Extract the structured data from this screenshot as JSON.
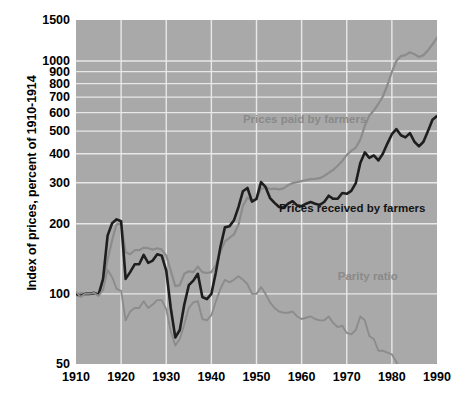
{
  "chart_data": {
    "type": "line",
    "title": "",
    "xlabel": "",
    "ylabel": "Index of prices, percent of 1910-1914",
    "yscale": "log",
    "ylim": [
      50,
      1500
    ],
    "xlim": [
      1910,
      1990
    ],
    "grid": true,
    "legend_position": "inline-annotations",
    "ytick_labels": [
      "1500",
      "1000",
      "900",
      "800",
      "700",
      "600",
      "500",
      "400",
      "300",
      "200",
      "100",
      "50"
    ],
    "ytick_values": [
      1500,
      1000,
      900,
      800,
      700,
      600,
      500,
      400,
      300,
      200,
      100,
      50
    ],
    "xtick_labels": [
      "1910",
      "1920",
      "1930",
      "1940",
      "1950",
      "1960",
      "1970",
      "1980",
      "1990"
    ],
    "xtick_values": [
      1910,
      1920,
      1930,
      1940,
      1950,
      1960,
      1970,
      1980,
      1990
    ],
    "plot_background": "#a9a9a9",
    "gridline_color": "#e8e8e8",
    "series": [
      {
        "name": "Prices paid by farmers",
        "color": "#8c8c8c",
        "label_color": "#8a8a8a",
        "label_x": 1947,
        "label_y": 560,
        "x": [
          1910,
          1911,
          1912,
          1913,
          1914,
          1915,
          1916,
          1917,
          1918,
          1919,
          1920,
          1921,
          1922,
          1923,
          1924,
          1925,
          1926,
          1927,
          1928,
          1929,
          1930,
          1931,
          1932,
          1933,
          1934,
          1935,
          1936,
          1937,
          1938,
          1939,
          1940,
          1941,
          1942,
          1943,
          1944,
          1945,
          1946,
          1947,
          1948,
          1949,
          1950,
          1951,
          1952,
          1953,
          1954,
          1955,
          1956,
          1957,
          1958,
          1959,
          1960,
          1961,
          1962,
          1963,
          1964,
          1965,
          1966,
          1967,
          1968,
          1969,
          1970,
          1971,
          1972,
          1973,
          1974,
          1975,
          1976,
          1977,
          1978,
          1979,
          1980,
          1981,
          1982,
          1983,
          1984,
          1985,
          1986,
          1987,
          1988,
          1989,
          1990
        ],
        "values": [
          98,
          101,
          100,
          100,
          100,
          101,
          112,
          140,
          170,
          199,
          200,
          151,
          148,
          154,
          154,
          158,
          157,
          155,
          157,
          155,
          146,
          126,
          108,
          109,
          122,
          125,
          124,
          131,
          124,
          123,
          124,
          133,
          152,
          168,
          174,
          180,
          198,
          239,
          259,
          250,
          256,
          282,
          287,
          282,
          283,
          281,
          284,
          293,
          299,
          302,
          305,
          308,
          311,
          312,
          314,
          321,
          331,
          341,
          355,
          372,
          395,
          411,
          425,
          459,
          527,
          583,
          613,
          654,
          704,
          787,
          898,
          1000,
          1050,
          1060,
          1090,
          1070,
          1040,
          1060,
          1110,
          1180,
          1260
        ]
      },
      {
        "name": "Prices received by farmers",
        "color": "#1e1e1e",
        "label_color": "#141414",
        "label_x": 1955,
        "label_y": 232,
        "x": [
          1910,
          1911,
          1912,
          1913,
          1914,
          1915,
          1916,
          1917,
          1918,
          1919,
          1920,
          1921,
          1922,
          1923,
          1924,
          1925,
          1926,
          1927,
          1928,
          1929,
          1930,
          1931,
          1932,
          1933,
          1934,
          1935,
          1936,
          1937,
          1938,
          1939,
          1940,
          1941,
          1942,
          1943,
          1944,
          1945,
          1946,
          1947,
          1948,
          1949,
          1950,
          1951,
          1952,
          1953,
          1954,
          1955,
          1956,
          1957,
          1958,
          1959,
          1960,
          1961,
          1962,
          1963,
          1964,
          1965,
          1966,
          1967,
          1968,
          1969,
          1970,
          1971,
          1972,
          1973,
          1974,
          1975,
          1976,
          1977,
          1978,
          1979,
          1980,
          1981,
          1982,
          1983,
          1984,
          1985,
          1986,
          1987,
          1988,
          1989,
          1990
        ],
        "values": [
          100,
          98,
          100,
          100,
          101,
          99,
          116,
          178,
          201,
          209,
          205,
          116,
          124,
          134,
          134,
          147,
          136,
          139,
          148,
          146,
          126,
          87,
          65,
          70,
          90,
          109,
          114,
          122,
          97,
          95,
          100,
          124,
          159,
          193,
          195,
          207,
          236,
          276,
          285,
          249,
          256,
          302,
          288,
          258,
          246,
          236,
          235,
          244,
          250,
          240,
          238,
          244,
          248,
          244,
          241,
          248,
          264,
          256,
          256,
          271,
          269,
          277,
          299,
          365,
          405,
          384,
          393,
          374,
          400,
          442,
          485,
          510,
          480,
          470,
          490,
          450,
          430,
          450,
          500,
          560,
          580
        ]
      },
      {
        "name": "Parity ratio",
        "color": "#8c8c8c",
        "label_color": "#8a8a8a",
        "label_x": 1968,
        "label_y": 118,
        "x": [
          1910,
          1911,
          1912,
          1913,
          1914,
          1915,
          1916,
          1917,
          1918,
          1919,
          1920,
          1921,
          1922,
          1923,
          1924,
          1925,
          1926,
          1927,
          1928,
          1929,
          1930,
          1931,
          1932,
          1933,
          1934,
          1935,
          1936,
          1937,
          1938,
          1939,
          1940,
          1941,
          1942,
          1943,
          1944,
          1945,
          1946,
          1947,
          1948,
          1949,
          1950,
          1951,
          1952,
          1953,
          1954,
          1955,
          1956,
          1957,
          1958,
          1959,
          1960,
          1961,
          1962,
          1963,
          1964,
          1965,
          1966,
          1967,
          1968,
          1969,
          1970,
          1971,
          1972,
          1973,
          1974,
          1975,
          1976,
          1977,
          1978,
          1979,
          1980,
          1981,
          1982,
          1983,
          1984,
          1985,
          1986,
          1987,
          1988,
          1989,
          1990
        ],
        "values": [
          102,
          97,
          100,
          100,
          101,
          98,
          104,
          127,
          118,
          105,
          103,
          77,
          84,
          87,
          87,
          93,
          87,
          90,
          94,
          94,
          86,
          69,
          60,
          64,
          74,
          87,
          92,
          93,
          78,
          77,
          81,
          93,
          105,
          115,
          112,
          115,
          119,
          115,
          110,
          100,
          100,
          107,
          100,
          92,
          87,
          84,
          83,
          83,
          84,
          80,
          78,
          79,
          80,
          78,
          77,
          77,
          80,
          75,
          72,
          73,
          68,
          67,
          70,
          80,
          77,
          66,
          64,
          57,
          57,
          56,
          55,
          51,
          46,
          44,
          45,
          42,
          41,
          43,
          45,
          48,
          50
        ]
      }
    ]
  },
  "axis": {
    "ylabel": "Index of prices, percent of 1910-1914"
  }
}
